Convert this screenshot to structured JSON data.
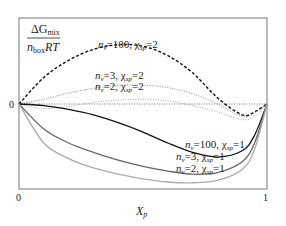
{
  "chart_data": {
    "type": "line",
    "title": "",
    "ylabel": {
      "numerator": "ΔG",
      "numerator_sub": "mix",
      "denominator_n": "n",
      "denominator_sub": "box",
      "denominator_rest": "RT"
    },
    "xlabel": {
      "main": "X",
      "sub": "p"
    },
    "x_ticks": [
      "0",
      "1"
    ],
    "y_ticks": [
      "0"
    ],
    "xlim": [
      0,
      1
    ],
    "grid": false,
    "zero_line": {
      "style": "dotted",
      "color": "#555555"
    },
    "series": [
      {
        "name": "n_v=100, χ_sp=2",
        "style": "dashed",
        "color": "#111111",
        "label_parts": [
          "n",
          "v",
          "=100, χ",
          "sp",
          "=2"
        ],
        "x": [
          0,
          0.1,
          0.2,
          0.3,
          0.4,
          0.5,
          0.6,
          0.7,
          0.8,
          0.9,
          0.95,
          1.0
        ],
        "y": [
          0,
          0.34,
          0.56,
          0.7,
          0.76,
          0.74,
          0.62,
          0.4,
          0.08,
          -0.14,
          -0.1,
          0
        ]
      },
      {
        "name": "n_v=3, χ_sp=2",
        "style": "dotted",
        "color": "#888888",
        "label_parts": [
          "n",
          "v",
          "=3, χ",
          "sp",
          "=2"
        ],
        "x": [
          0,
          0.1,
          0.2,
          0.3,
          0.4,
          0.5,
          0.6,
          0.7,
          0.8,
          0.9,
          0.95,
          1.0
        ],
        "y": [
          0,
          0.06,
          0.14,
          0.2,
          0.24,
          0.24,
          0.21,
          0.13,
          0.0,
          -0.16,
          -0.12,
          0
        ]
      },
      {
        "name": "n_v=2, χ_sp=2",
        "style": "dotted",
        "color": "#aaaaaa",
        "label_parts": [
          "n",
          "v",
          "=2, χ",
          "sp",
          "=2"
        ],
        "x": [
          0,
          0.1,
          0.2,
          0.3,
          0.4,
          0.5,
          0.6,
          0.7,
          0.8,
          0.9,
          0.95,
          1.0
        ],
        "y": [
          0,
          -0.06,
          -0.03,
          0.02,
          0.05,
          0.06,
          0.04,
          -0.02,
          -0.1,
          -0.2,
          -0.16,
          0
        ]
      },
      {
        "name": "n_v=100, χ_sp=1",
        "style": "solid",
        "color": "#111111",
        "label_parts": [
          "n",
          "v",
          "=100, χ",
          "sp",
          "=1"
        ],
        "x": [
          0,
          0.1,
          0.2,
          0.3,
          0.4,
          0.5,
          0.6,
          0.7,
          0.8,
          0.9,
          0.95,
          1.0
        ],
        "y": [
          0,
          -0.02,
          -0.07,
          -0.14,
          -0.24,
          -0.36,
          -0.5,
          -0.62,
          -0.68,
          -0.6,
          -0.4,
          0
        ]
      },
      {
        "name": "n_v=3, χ_sp=1",
        "style": "solid",
        "color": "#666666",
        "label_parts": [
          "n",
          "v",
          "=3, χ",
          "sp",
          "=1"
        ],
        "x": [
          0,
          0.1,
          0.2,
          0.3,
          0.4,
          0.5,
          0.6,
          0.7,
          0.8,
          0.9,
          0.95,
          1.0
        ],
        "y": [
          0,
          -0.32,
          -0.5,
          -0.62,
          -0.72,
          -0.8,
          -0.86,
          -0.9,
          -0.88,
          -0.74,
          -0.5,
          0
        ]
      },
      {
        "name": "n_v=2, χ_sp=1",
        "style": "solid",
        "color": "#aaaaaa",
        "label_parts": [
          "n",
          "v",
          "=2, χ",
          "sp",
          "=1"
        ],
        "x": [
          0,
          0.1,
          0.2,
          0.3,
          0.4,
          0.5,
          0.6,
          0.7,
          0.8,
          0.9,
          0.95,
          1.0
        ],
        "y": [
          0,
          -0.5,
          -0.7,
          -0.82,
          -0.9,
          -0.96,
          -1.0,
          -1.01,
          -0.98,
          -0.84,
          -0.58,
          0
        ]
      }
    ]
  },
  "labels": {
    "zero_y": "0",
    "zero_x": "0",
    "one_x": "1"
  }
}
